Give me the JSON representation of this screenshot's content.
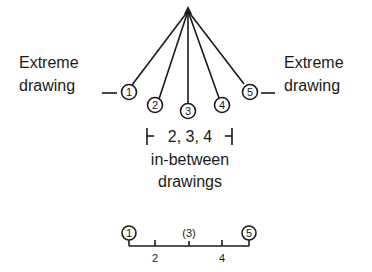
{
  "labels": {
    "left_extreme_line1": "Extreme",
    "left_extreme_line2": "drawing",
    "right_extreme_line1": "Extreme",
    "right_extreme_line2": "drawing",
    "inbetween_range": "2, 3, 4",
    "inbetween_line1": "in-between",
    "inbetween_line2": "drawings"
  },
  "fan_nodes": [
    "1",
    "2",
    "3",
    "4",
    "5"
  ],
  "timeline": {
    "keys": [
      "1",
      "5"
    ],
    "middle": "(3)",
    "ticks": [
      "2",
      "4"
    ]
  },
  "colors": {
    "ink": "#1a1a1a",
    "background": "#ffffff"
  }
}
